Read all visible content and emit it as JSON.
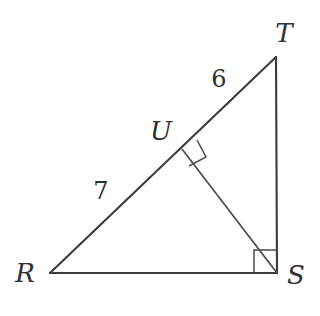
{
  "figure": {
    "background_color": "#ffffff",
    "line_color": "#3c3c3c",
    "label_color": "#2f2f2f",
    "width": 320,
    "height": 316
  },
  "vertices": [
    {
      "name": "R",
      "label": "R",
      "x": 50,
      "y": 273,
      "label_x": 25,
      "label_y": 282
    },
    {
      "name": "S",
      "label": "S",
      "x": 277,
      "y": 273,
      "label_x": 296,
      "label_y": 284
    },
    {
      "name": "T",
      "label": "T",
      "x": 276,
      "y": 57,
      "label_x": 284,
      "label_y": 42
    },
    {
      "name": "U",
      "label": "U",
      "x": 182,
      "y": 149,
      "label_x": 161,
      "label_y": 140
    }
  ],
  "segments": [
    {
      "name": "RS",
      "from": "R",
      "to": "S",
      "x1": 50,
      "y1": 273,
      "x2": 277,
      "y2": 273
    },
    {
      "name": "TS",
      "from": "T",
      "to": "S",
      "x1": 276,
      "y1": 57,
      "x2": 277,
      "y2": 273
    },
    {
      "name": "RT",
      "from": "R",
      "to": "T",
      "x1": 50,
      "y1": 273,
      "x2": 276,
      "y2": 57
    },
    {
      "name": "US",
      "from": "U",
      "to": "S",
      "x1": 182,
      "y1": 149,
      "x2": 277,
      "y2": 273
    }
  ],
  "measures": [
    {
      "name": "RU",
      "label": "7",
      "x": 101,
      "y": 199,
      "segment": "RU"
    },
    {
      "name": "UT",
      "label": "6",
      "x": 219,
      "y": 87,
      "segment": "UT"
    }
  ],
  "right_angles": [
    {
      "name": "right-angle-at-s",
      "at": "S",
      "points": "254,273 254,250 277,250"
    },
    {
      "name": "right-angle-at-u",
      "at": "U",
      "points": "197,140 206,157 189,166"
    }
  ]
}
